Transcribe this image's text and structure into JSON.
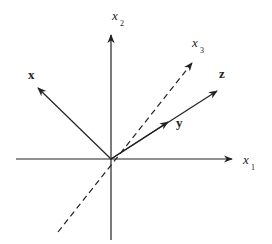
{
  "diagram": {
    "title": "",
    "colors": {
      "ink": "#222222",
      "background": "#ffffff"
    },
    "origin": [
      111,
      159
    ],
    "axes": [
      {
        "id": "x1",
        "label": "x",
        "subscript": "1",
        "style": "solid",
        "from": [
          16,
          159
        ],
        "to": [
          232,
          159
        ],
        "label_pos": [
          243,
          164
        ],
        "sub_pos": [
          251,
          170
        ]
      },
      {
        "id": "x2",
        "label": "x",
        "subscript": "2",
        "style": "solid",
        "from": [
          111,
          240
        ],
        "to": [
          111,
          35
        ],
        "label_pos": [
          112,
          20
        ],
        "sub_pos": [
          120,
          26
        ]
      },
      {
        "id": "x3",
        "label": "x",
        "subscript": "3",
        "style": "dashed",
        "from": [
          58,
          232
        ],
        "to": [
          192,
          63
        ],
        "label_pos": [
          192,
          47
        ],
        "sub_pos": [
          200,
          53
        ]
      }
    ],
    "vectors": [
      {
        "id": "x",
        "label": "x",
        "from": [
          111,
          159
        ],
        "to": [
          38,
          88
        ],
        "label_pos": [
          28,
          79
        ]
      },
      {
        "id": "z",
        "label": "z",
        "from": [
          111,
          159
        ],
        "to": [
          217,
          91
        ],
        "label_pos": [
          219,
          78
        ]
      },
      {
        "id": "y",
        "label": "y",
        "from": [
          111,
          159
        ],
        "to": [
          168,
          122
        ],
        "label_pos": [
          176,
          127
        ],
        "note": "arrowhead drawn mid-way along z direction"
      }
    ]
  }
}
